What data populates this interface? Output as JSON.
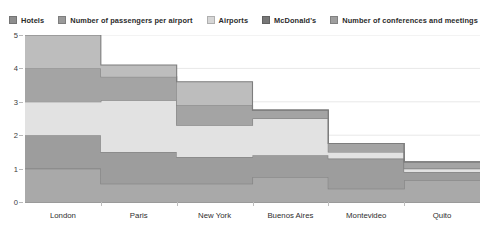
{
  "chart_data": {
    "type": "area",
    "subtype": "stacked-step-area",
    "title": "",
    "subtitle": "",
    "xlabel": "",
    "ylabel": "",
    "categories": [
      "London",
      "Paris",
      "New York",
      "Buenos Aires",
      "Montevideo",
      "Quito"
    ],
    "ylim": [
      0,
      5
    ],
    "ytick_labels": [
      "0",
      "1",
      "2",
      "3",
      "4",
      "5"
    ],
    "ytick_values": [
      0,
      1,
      2,
      3,
      4,
      5
    ],
    "grid": true,
    "grid_axis": "y",
    "legend_position": "top-center",
    "stacked": true,
    "step_mode": "mid",
    "series": [
      {
        "name": "Hotels",
        "color": "#a9a9a9",
        "values": [
          1,
          0.55,
          0.55,
          0.75,
          0.4,
          0.65
        ]
      },
      {
        "name": "Number of passengers per airport",
        "color": "#9d9d9d",
        "values": [
          1,
          0.95,
          0.8,
          0.65,
          0.9,
          0.25
        ]
      },
      {
        "name": "Airports",
        "color": "#e2e2e2",
        "values": [
          1,
          1.55,
          0.95,
          1.1,
          0.2,
          0.1
        ]
      },
      {
        "name": "McDonald's",
        "color": "#a4a4a4",
        "values": [
          1,
          0.7,
          0.6,
          0.25,
          0.25,
          0.2
        ]
      },
      {
        "name": "Number of conferences and meetings",
        "color": "#bdbdbd",
        "values": [
          1,
          0.35,
          0.7,
          0,
          0,
          0
        ]
      }
    ],
    "cumulative_totals": [
      5,
      4.1,
      3.6,
      2.75,
      1.75,
      1.2
    ]
  },
  "axis": {
    "line_color": "#9a9a9a",
    "grid_color": "#e8e8e8",
    "tick_color": "#b9b9b9",
    "label_color": "#2e2e2e"
  },
  "legend": {
    "items": [
      {
        "label": "Hotels",
        "swatch": "legend-swatch-hotels",
        "color": "#8e8e8e"
      },
      {
        "label": "Number of passengers per airport",
        "swatch": "legend-swatch-passengers",
        "color": "#9a9a9a"
      },
      {
        "label": "Airports",
        "swatch": "legend-swatch-airports",
        "color": "#d6d6d6"
      },
      {
        "label": "McDonald's",
        "swatch": "legend-swatch-mcdonalds",
        "color": "#777777"
      },
      {
        "label": "Number of conferences and meetings",
        "swatch": "legend-swatch-conferences",
        "color": "#9e9e9e"
      }
    ]
  }
}
